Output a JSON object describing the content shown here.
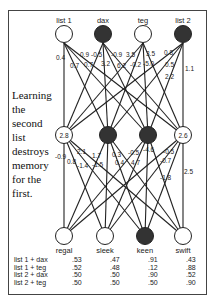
{
  "inputs": [
    {
      "label": "list 1",
      "active": false
    },
    {
      "label": "dax",
      "active": true
    },
    {
      "label": "teg",
      "active": false
    },
    {
      "label": "list 2",
      "active": true
    }
  ],
  "hidden": [
    {
      "value": "2.8",
      "active": false
    },
    {
      "value": "",
      "active": true
    },
    {
      "value": "",
      "active": true
    },
    {
      "value": "2.6",
      "active": false
    }
  ],
  "outputs": [
    {
      "label": "regal",
      "active": false
    },
    {
      "label": "sleek",
      "active": false
    },
    {
      "label": "keen",
      "active": true
    },
    {
      "label": "swift",
      "active": false
    }
  ],
  "weights_top": [
    "0.4",
    "0.7",
    "0.9",
    "0.7",
    "-0.5",
    "3.2",
    "-0.9",
    "6.2",
    "3.5",
    "-0.2",
    "3.5",
    "-5.0",
    "0.8",
    "0.5",
    "2.2",
    "1.1"
  ],
  "weights_bottom": [
    "-0.9",
    "2.1",
    "0.8",
    "-1.4",
    "1.7",
    "-1.5",
    "0.3",
    "0.4",
    "-0.5",
    "4.7",
    "-4.6",
    "-0.5",
    "-0.7",
    "-1.8",
    "2.5"
  ],
  "caption": [
    "Learning",
    "the",
    "second",
    "list",
    "destroys",
    "memory",
    "for the",
    "first."
  ],
  "table": {
    "columns": [
      "regal",
      "sleek",
      "keen",
      "swift"
    ],
    "rows": [
      {
        "label": "list 1 + dax",
        "values": [
          ".53",
          ".47",
          ".91",
          ".43"
        ]
      },
      {
        "label": "list 1 + teg",
        "values": [
          ".52",
          ".48",
          ".12",
          ".88"
        ]
      },
      {
        "label": "list 2 + dax",
        "values": [
          ".50",
          ".50",
          ".90",
          ".52"
        ]
      },
      {
        "label": "list 2 + teg",
        "values": [
          ".50",
          ".50",
          ".50",
          ".90"
        ]
      }
    ]
  },
  "colors": {
    "active_node": "#333333",
    "inactive_node": "#ffffff",
    "line": "#222222"
  }
}
